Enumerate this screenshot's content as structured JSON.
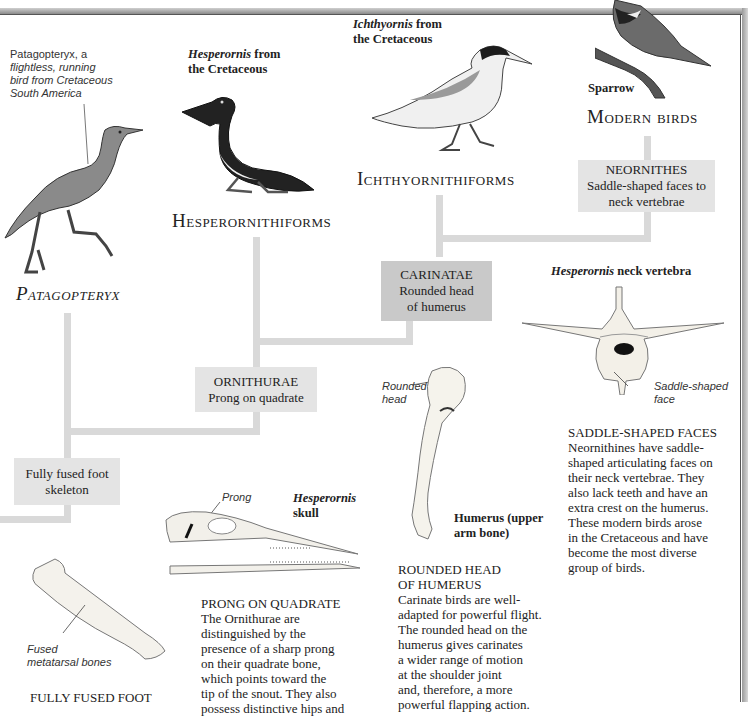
{
  "figure": {
    "taxa": {
      "patagopteryx": {
        "title": "Patagopteryx",
        "caption": [
          "Patagopteryx, a",
          "flightless, running",
          "bird from Cretaceous",
          "South America"
        ]
      },
      "hesperornithiforms": {
        "title": "Hesperornithiforms",
        "caption_italic": "Hesperornis",
        "caption_rest": " from",
        "caption_line2": "the Cretaceous"
      },
      "ichthyornithiforms": {
        "title": "Ichthyornithiforms",
        "caption_italic": "Ichthyornis",
        "caption_rest": " from",
        "caption_line2": "the Cretaceous"
      },
      "modern_birds": {
        "title": "Modern birds",
        "caption": "Sparrow"
      }
    },
    "nodes": {
      "neornithes": {
        "name": "NEORNITHES",
        "trait_lines": [
          "Saddle-shaped faces to",
          "neck vertebrae"
        ]
      },
      "carinatae": {
        "name": "CARINATAE",
        "trait_lines": [
          "Rounded head",
          "of humerus"
        ]
      },
      "ornithurae": {
        "name": "ORNITHURAE",
        "trait_lines": [
          "Prong on quadrate"
        ]
      },
      "fused_foot": {
        "trait_lines": [
          "Fully fused foot",
          "skeleton"
        ]
      }
    },
    "specimens": {
      "vertebra": {
        "title_italic": "Hesperornis",
        "title_rest": " neck vertebra",
        "label": [
          "Saddle-shaped",
          "face"
        ]
      },
      "humerus": {
        "label": [
          "Rounded",
          "head"
        ],
        "title": [
          "Humerus (upper",
          "arm bone)"
        ]
      },
      "skull": {
        "label": "Prong",
        "title_italic": "Hesperornis",
        "title_line2": "skull"
      },
      "metatarsal": {
        "label": [
          "Fused",
          "metatarsal bones"
        ]
      }
    },
    "descriptions": {
      "saddle": {
        "heading": "SADDLE-SHAPED FACES",
        "lines": [
          "Neornithines have saddle-",
          "shaped articulating faces on",
          "their neck vertebrae. They",
          "also lack teeth and have an",
          "extra crest on the humerus.",
          "These modern birds arose",
          "in the Cretaceous and have",
          "become the most diverse",
          "group of birds."
        ]
      },
      "rounded": {
        "heading_lines": [
          "ROUNDED HEAD",
          "OF HUMERUS"
        ],
        "lines": [
          "Carinate birds are well-",
          "adapted for powerful flight.",
          "The rounded head on the",
          "humerus gives carinates",
          "a wider range of motion",
          "at the shoulder joint",
          "and, therefore, a more",
          "powerful flapping action."
        ]
      },
      "prong": {
        "heading": "PRONG ON QUADRATE",
        "lines": [
          "The Ornithurae are",
          "distinguished by the",
          "presence of a sharp prong",
          "on their quadrate bone,",
          "which points toward the",
          "tip of the snout. They also",
          "possess distinctive hips and"
        ]
      },
      "foot": {
        "heading": "FULLY FUSED FOOT"
      }
    },
    "colors": {
      "branch_line": "#d9d9d9",
      "light_box": "#e4e4e4",
      "dark_box": "#c9c9c9",
      "text": "#222222"
    }
  }
}
